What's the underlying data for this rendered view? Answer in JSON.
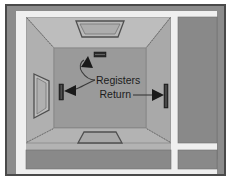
{
  "diagram": {
    "type": "architectural-perspective-diagram",
    "labels": {
      "registers": "Registers",
      "return": "Return"
    },
    "colors": {
      "page_background": "#ffffff",
      "outer_border": "#4a4a4a",
      "outer_field": "#8c8c8c",
      "frame_light": "#efefef",
      "wall_light": "#b9b9b9",
      "wall_mid": "#a8a8a8",
      "wall_back": "#9a9a9a",
      "floor": "#9e9e9e",
      "ceiling": "#b5b5b5",
      "adjacent_room": "#898989",
      "grille_dark": "#2b2b2b",
      "leader_line": "#3a3a3a",
      "text": "#1c1c1c"
    },
    "elements": [
      {
        "name": "ceiling-register",
        "kind": "trapezoid-opening",
        "position": "top-wall-center"
      },
      {
        "name": "floor-opening",
        "kind": "trapezoid-opening",
        "position": "bottom-wall-center"
      },
      {
        "name": "left-wall-window",
        "kind": "window-perspective",
        "position": "left-wall"
      },
      {
        "name": "back-wall-register",
        "kind": "small-grille",
        "position": "back-wall-upper-center"
      },
      {
        "name": "left-wall-register",
        "kind": "vertical-grille",
        "position": "left-wall-mid"
      },
      {
        "name": "return-grille",
        "kind": "tall-vertical-grille",
        "position": "right-wall-mid"
      },
      {
        "name": "adjacent-room-right",
        "kind": "room-block",
        "position": "right-side"
      },
      {
        "name": "adjacent-room-bottom-left",
        "kind": "room-block",
        "position": "bottom-left"
      },
      {
        "name": "adjacent-room-bottom-right",
        "kind": "room-block",
        "position": "bottom-right"
      }
    ],
    "annotations": [
      {
        "label_key": "registers",
        "points_to": [
          "back-wall-register",
          "left-wall-register"
        ],
        "leader": "branched-curve"
      },
      {
        "label_key": "return",
        "points_to": [
          "return-grille"
        ],
        "leader": "straight-horizontal"
      }
    ]
  }
}
